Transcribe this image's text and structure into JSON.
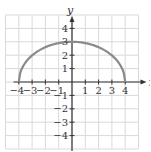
{
  "chart_data": {
    "type": "line",
    "title": "",
    "xlabel": "x",
    "ylabel": "y",
    "xlim": [
      -5,
      5
    ],
    "ylim": [
      -5,
      5
    ],
    "grid": true,
    "x_ticks": [
      -4,
      -3,
      -2,
      -1,
      1,
      2,
      3,
      4
    ],
    "y_ticks": [
      -4,
      -3,
      -2,
      -1,
      1,
      2,
      3,
      4
    ],
    "x_tick_labels": [
      "−4",
      "−3",
      "−2",
      "−1",
      "1",
      "2",
      "3",
      "4"
    ],
    "y_tick_labels": [
      "−4",
      "−3",
      "−2",
      "−1",
      "1",
      "2",
      "3",
      "4"
    ],
    "series": [
      {
        "name": "upper half ellipse",
        "description": "y = 3·sqrt(1 − x²/16), x in [−4, 4]",
        "x": [
          -4,
          -3,
          -2,
          -1,
          0,
          1,
          2,
          3,
          4
        ],
        "values": [
          0,
          1.98,
          2.6,
          2.9,
          3,
          2.9,
          2.6,
          1.98,
          0
        ],
        "color": "#8a8a8a"
      }
    ]
  },
  "colors": {
    "grid": "#d9d9d9",
    "axis": "#333333",
    "curve": "#8a8a8a"
  }
}
